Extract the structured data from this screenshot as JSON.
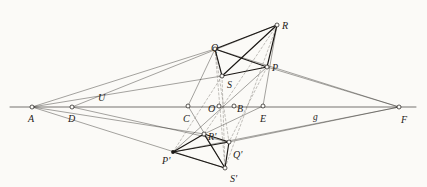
{
  "figure": {
    "background_color": "#fbfaf7",
    "ink_color": "#2a2724",
    "heavy_ink_color": "#1a1714",
    "dashed_ink_color": "#8d8a84",
    "width": 427,
    "height": 187
  },
  "points": [
    {
      "id": "A",
      "label": "A",
      "x": 32,
      "y": 107,
      "marker": "open-circle",
      "label_dx": -4,
      "label_dy": 7,
      "on_axis": true
    },
    {
      "id": "D",
      "label": "D",
      "x": 72,
      "y": 107,
      "marker": "open-circle",
      "label_dx": -4,
      "label_dy": 7,
      "on_axis": true
    },
    {
      "id": "U",
      "label": "U",
      "x": 101,
      "y": 96,
      "marker": "none",
      "label_dx": -3,
      "label_dy": -3,
      "on_axis": false
    },
    {
      "id": "C",
      "label": "C",
      "x": 188,
      "y": 106,
      "marker": "open-circle",
      "label_dx": -5,
      "label_dy": 8,
      "on_axis": true
    },
    {
      "id": "O",
      "label": "O",
      "x": 219,
      "y": 106,
      "marker": "open-circle",
      "label_dx": -11,
      "label_dy": -2,
      "on_axis": true
    },
    {
      "id": "B",
      "label": "B",
      "x": 234,
      "y": 106,
      "marker": "open-circle",
      "label_dx": 3,
      "label_dy": -2,
      "on_axis": true
    },
    {
      "id": "E",
      "label": "E",
      "x": 263,
      "y": 106,
      "marker": "open-circle",
      "label_dx": -3,
      "label_dy": 8,
      "on_axis": true
    },
    {
      "id": "F",
      "label": "F",
      "x": 399,
      "y": 107,
      "marker": "open-circle",
      "label_dx": 2,
      "label_dy": 8,
      "on_axis": true
    },
    {
      "id": "Q",
      "label": "Q",
      "x": 215,
      "y": 49,
      "marker": "open-circle",
      "label_dx": -4,
      "label_dy": -6,
      "on_axis": false
    },
    {
      "id": "R",
      "label": "R",
      "x": 277,
      "y": 25,
      "marker": "open-circle",
      "label_dx": 5,
      "label_dy": -4,
      "on_axis": false
    },
    {
      "id": "P",
      "label": "P",
      "x": 267,
      "y": 67,
      "marker": "open-circle",
      "label_dx": 5,
      "label_dy": -4,
      "on_axis": false
    },
    {
      "id": "S",
      "label": "S",
      "x": 222,
      "y": 76,
      "marker": "open-circle",
      "label_dx": 5,
      "label_dy": 4,
      "on_axis": false
    },
    {
      "id": "Rp",
      "label": "R'",
      "x": 204,
      "y": 134,
      "marker": "open-circle",
      "label_dx": 4,
      "label_dy": -2,
      "on_axis": false
    },
    {
      "id": "Qp",
      "label": "Q'",
      "x": 229,
      "y": 142,
      "marker": "open-circle",
      "label_dx": 4,
      "label_dy": 8,
      "on_axis": false
    },
    {
      "id": "Pp",
      "label": "P'",
      "x": 173,
      "y": 152,
      "marker": "filled-dot",
      "label_dx": -11,
      "label_dy": 4,
      "on_axis": false
    },
    {
      "id": "Sp",
      "label": "S'",
      "x": 225,
      "y": 168,
      "marker": "open-circle",
      "label_dx": 5,
      "label_dy": 6,
      "on_axis": false
    }
  ],
  "line_labels": [
    {
      "id": "g",
      "label": "g",
      "x": 313,
      "y": 113
    }
  ],
  "segments": {
    "axis": [
      {
        "from": "axis-left-end",
        "to": "axis-right-end",
        "weight": "medium"
      }
    ],
    "quadrangle_upper": [
      {
        "from": "Q",
        "to": "R",
        "weight": "heavy"
      },
      {
        "from": "R",
        "to": "P",
        "weight": "heavy"
      },
      {
        "from": "P",
        "to": "S",
        "weight": "heavy"
      },
      {
        "from": "S",
        "to": "Q",
        "weight": "heavy"
      },
      {
        "from": "Q",
        "to": "P",
        "weight": "heavy"
      },
      {
        "from": "R",
        "to": "S",
        "weight": "heavy"
      }
    ],
    "quadrangle_lower": [
      {
        "from": "Qp",
        "to": "Rp",
        "weight": "heavy"
      },
      {
        "from": "Rp",
        "to": "Pp",
        "weight": "heavy"
      },
      {
        "from": "Pp",
        "to": "Sp",
        "weight": "heavy"
      },
      {
        "from": "Sp",
        "to": "Qp",
        "weight": "heavy"
      },
      {
        "from": "Qp",
        "to": "Pp",
        "weight": "heavy"
      },
      {
        "from": "Rp",
        "to": "Sp",
        "weight": "heavy"
      }
    ],
    "pencil_from_A": [
      {
        "from": "A",
        "to": "Q",
        "weight": "light"
      },
      {
        "from": "A",
        "to": "S",
        "weight": "light"
      },
      {
        "from": "A",
        "to": "Rp",
        "weight": "light"
      },
      {
        "from": "A",
        "to": "Sp",
        "weight": "light"
      }
    ],
    "pencil_from_F": [
      {
        "from": "F",
        "to": "Q",
        "weight": "light"
      },
      {
        "from": "F",
        "to": "P",
        "weight": "light"
      },
      {
        "from": "F",
        "to": "Qp",
        "weight": "light"
      },
      {
        "from": "F",
        "to": "Pp",
        "weight": "light"
      }
    ],
    "perspective_rays": [
      {
        "from": "D",
        "to": "R",
        "weight": "light"
      },
      {
        "from": "D",
        "to": "Qp",
        "weight": "light"
      },
      {
        "from": "C",
        "to": "Q",
        "weight": "light"
      },
      {
        "from": "C",
        "to": "Sp",
        "weight": "light"
      },
      {
        "from": "E",
        "to": "Rp",
        "weight": "light"
      },
      {
        "from": "E",
        "to": "R",
        "weight": "light"
      },
      {
        "from": "Pp",
        "to": "P",
        "weight": "light"
      }
    ],
    "dashed_correspondences": [
      {
        "from": "Q",
        "to": "Sp",
        "weight": "dashed"
      },
      {
        "from": "R",
        "to": "Sp",
        "weight": "dashed"
      },
      {
        "from": "R",
        "to": "Rp",
        "weight": "dashed"
      },
      {
        "from": "S",
        "to": "Sp",
        "weight": "dashed"
      },
      {
        "from": "S",
        "to": "Pp",
        "weight": "dashed"
      },
      {
        "from": "Q",
        "to": "Qp",
        "weight": "dashed"
      },
      {
        "from": "P",
        "to": "Qp",
        "weight": "dashed"
      }
    ]
  },
  "axis_endpoints": {
    "left": {
      "x": 10,
      "y": 107
    },
    "right": {
      "x": 416,
      "y": 107
    }
  }
}
